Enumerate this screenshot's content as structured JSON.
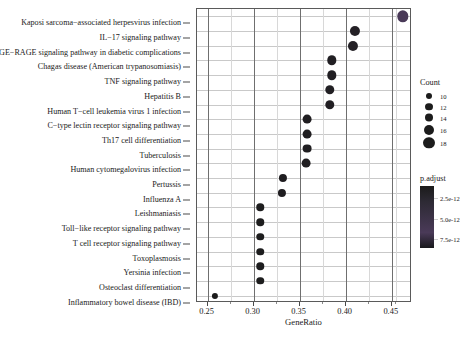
{
  "chart_data": {
    "type": "scatter",
    "title": "",
    "xlabel": "GeneRatio",
    "ylabel": "",
    "xlim": [
      0.2385,
      0.472
    ],
    "xticks": [
      0.25,
      0.3,
      0.35,
      0.4,
      0.45
    ],
    "xtick_labels": [
      "0.25",
      "0.30",
      "0.35",
      "0.40",
      "0.45"
    ],
    "xticks_minor": [
      0.275,
      0.325,
      0.375,
      0.425,
      0.455
    ],
    "grid": "horizontal-and-vertical",
    "legend_position": "right",
    "size_legend": {
      "title": "Count",
      "values": [
        10,
        12,
        14,
        16,
        18
      ],
      "labels": [
        "10",
        "12",
        "14",
        "16",
        "18"
      ]
    },
    "color_legend": {
      "title": "p.adjust",
      "tick_values": [
        2.5e-12,
        5e-12,
        7.5e-12
      ],
      "tick_labels": [
        "2.5e-12",
        "5.0e-12",
        "7.5e-12"
      ],
      "low_color": "#1b1b1b",
      "high_color": "#4a3a58"
    },
    "categories": [
      "Kaposi sarcoma−associated herpesvirus infection",
      "IL−17 signaling pathway",
      "AGE−RAGE signaling pathway in diabetic complications",
      "Chagas disease (American trypanosomiasis)",
      "TNF signaling pathway",
      "Hepatitis B",
      "Human T−cell leukemia virus 1 infection",
      "C−type lectin receptor signaling pathway",
      "Th17 cell differentiation",
      "Tuberculosis",
      "Human cytomegalovirus infection",
      "Pertussis",
      "Influenza A",
      "Leishmaniasis",
      "Toll−like receptor signaling pathway",
      "T cell receptor signaling pathway",
      "Toxoplasmosis",
      "Yersinia infection",
      "Osteoclast differentiation",
      "Inflammatory bowel disease (IBD)"
    ],
    "points": [
      {
        "label": "Kaposi sarcoma−associated herpesvirus infection",
        "gene_ratio": 0.462,
        "count": 18,
        "p_adjust": 7.9e-12
      },
      {
        "label": "IL−17 signaling pathway",
        "gene_ratio": 0.41,
        "count": 16,
        "p_adjust": 1.6e-12
      },
      {
        "label": "AGE−RAGE signaling pathway in diabetic complications",
        "gene_ratio": 0.408,
        "count": 16,
        "p_adjust": 1.6e-12
      },
      {
        "label": "Chagas disease (American trypanosomiasis)",
        "gene_ratio": 0.385,
        "count": 15,
        "p_adjust": 1.2e-12
      },
      {
        "label": "TNF signaling pathway",
        "gene_ratio": 0.385,
        "count": 15,
        "p_adjust": 1.2e-12
      },
      {
        "label": "Hepatitis B",
        "gene_ratio": 0.383,
        "count": 15,
        "p_adjust": 1.2e-12
      },
      {
        "label": "Human T−cell leukemia virus 1 infection",
        "gene_ratio": 0.383,
        "count": 15,
        "p_adjust": 1.2e-12
      },
      {
        "label": "C−type lectin receptor signaling pathway",
        "gene_ratio": 0.358,
        "count": 14,
        "p_adjust": 1e-12
      },
      {
        "label": "Th17 cell differentiation",
        "gene_ratio": 0.358,
        "count": 14,
        "p_adjust": 1e-12
      },
      {
        "label": "Tuberculosis",
        "gene_ratio": 0.358,
        "count": 14,
        "p_adjust": 1e-12
      },
      {
        "label": "Human cytomegalovirus infection",
        "gene_ratio": 0.357,
        "count": 14,
        "p_adjust": 1e-12
      },
      {
        "label": "Pertussis",
        "gene_ratio": 0.332,
        "count": 13,
        "p_adjust": 8e-13
      },
      {
        "label": "Influenza A",
        "gene_ratio": 0.331,
        "count": 13,
        "p_adjust": 8e-13
      },
      {
        "label": "Leishmaniasis",
        "gene_ratio": 0.307,
        "count": 12,
        "p_adjust": 6e-13
      },
      {
        "label": "Toll−like receptor signaling pathway",
        "gene_ratio": 0.307,
        "count": 12,
        "p_adjust": 6e-13
      },
      {
        "label": "T cell receptor signaling pathway",
        "gene_ratio": 0.307,
        "count": 12,
        "p_adjust": 6e-13
      },
      {
        "label": "Toxoplasmosis",
        "gene_ratio": 0.307,
        "count": 12,
        "p_adjust": 6e-13
      },
      {
        "label": "Yersinia infection",
        "gene_ratio": 0.307,
        "count": 12,
        "p_adjust": 6e-13
      },
      {
        "label": "Osteoclast differentiation",
        "gene_ratio": 0.307,
        "count": 12,
        "p_adjust": 6e-13
      },
      {
        "label": "Inflammatory bowel disease (IBD)",
        "gene_ratio": 0.258,
        "count": 10,
        "p_adjust": 2e-13
      }
    ]
  },
  "caption": ""
}
